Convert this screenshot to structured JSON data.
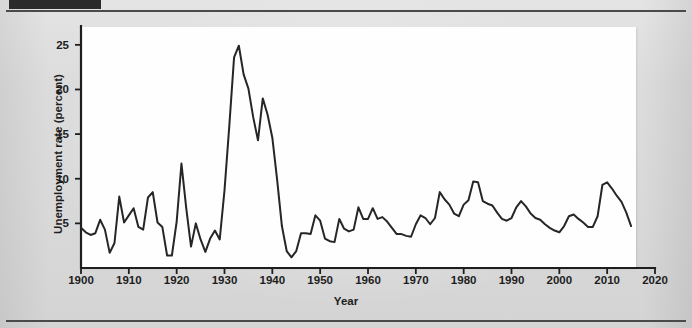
{
  "figure": {
    "x_axis_title": "Year",
    "y_axis_title": "Unemployment rate (percent)"
  },
  "chart_data": {
    "type": "line",
    "title": "",
    "xlabel": "Year",
    "ylabel": "Unemployment rate (percent)",
    "xlim": [
      1900,
      2020
    ],
    "ylim": [
      0,
      27
    ],
    "grid": false,
    "legend": null,
    "line_color": "#262626",
    "panel_color": "#fefefe",
    "xticks": [
      1900,
      1910,
      1920,
      1930,
      1940,
      1950,
      1960,
      1970,
      1980,
      1990,
      2000,
      2010,
      2020
    ],
    "yticks": [
      5,
      10,
      15,
      20,
      25
    ],
    "series": [
      {
        "name": "Unemployment rate",
        "x": [
          1900,
          1901,
          1902,
          1903,
          1904,
          1905,
          1906,
          1907,
          1908,
          1909,
          1910,
          1911,
          1912,
          1913,
          1914,
          1915,
          1916,
          1917,
          1918,
          1919,
          1920,
          1921,
          1922,
          1923,
          1924,
          1925,
          1926,
          1927,
          1928,
          1929,
          1930,
          1931,
          1932,
          1933,
          1934,
          1935,
          1936,
          1937,
          1938,
          1939,
          1940,
          1941,
          1942,
          1943,
          1944,
          1945,
          1946,
          1947,
          1948,
          1949,
          1950,
          1951,
          1952,
          1953,
          1954,
          1955,
          1956,
          1957,
          1958,
          1959,
          1960,
          1961,
          1962,
          1963,
          1964,
          1965,
          1966,
          1967,
          1968,
          1969,
          1970,
          1971,
          1972,
          1973,
          1974,
          1975,
          1976,
          1977,
          1978,
          1979,
          1980,
          1981,
          1982,
          1983,
          1984,
          1985,
          1986,
          1987,
          1988,
          1989,
          1990,
          1991,
          1992,
          1993,
          1994,
          1995,
          1996,
          1997,
          1998,
          1999,
          2000,
          2001,
          2002,
          2003,
          2004,
          2005,
          2006,
          2007,
          2008,
          2009,
          2010,
          2011,
          2012,
          2013,
          2014,
          2015
        ],
        "values": [
          4.5,
          4.0,
          3.7,
          3.9,
          5.4,
          4.3,
          1.7,
          2.8,
          8.0,
          5.1,
          5.9,
          6.7,
          4.6,
          4.3,
          7.9,
          8.5,
          5.1,
          4.6,
          1.4,
          1.4,
          5.2,
          11.7,
          6.7,
          2.4,
          5.0,
          3.2,
          1.8,
          3.3,
          4.2,
          3.2,
          8.7,
          15.9,
          23.6,
          24.9,
          21.7,
          20.1,
          16.9,
          14.3,
          19.0,
          17.2,
          14.6,
          9.9,
          4.7,
          1.9,
          1.2,
          1.9,
          3.9,
          3.9,
          3.8,
          5.9,
          5.3,
          3.3,
          3.0,
          2.9,
          5.5,
          4.4,
          4.1,
          4.3,
          6.8,
          5.5,
          5.5,
          6.7,
          5.5,
          5.7,
          5.2,
          4.5,
          3.8,
          3.8,
          3.6,
          3.5,
          4.9,
          5.9,
          5.6,
          4.9,
          5.6,
          8.5,
          7.7,
          7.1,
          6.1,
          5.8,
          7.1,
          7.6,
          9.7,
          9.6,
          7.5,
          7.2,
          7.0,
          6.2,
          5.5,
          5.3,
          5.6,
          6.8,
          7.5,
          6.9,
          6.1,
          5.6,
          5.4,
          4.9,
          4.5,
          4.2,
          4.0,
          4.7,
          5.8,
          6.0,
          5.5,
          5.1,
          4.6,
          4.6,
          5.8,
          9.3,
          9.6,
          8.9,
          8.1,
          7.4,
          6.2,
          4.7
        ]
      }
    ]
  }
}
